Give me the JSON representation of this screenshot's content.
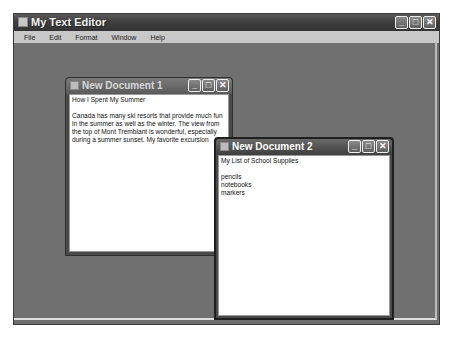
{
  "app": {
    "title": "My Text Editor",
    "controls": {
      "minimize": "_",
      "maximize": "□",
      "close": "✕"
    }
  },
  "menu": {
    "items": [
      {
        "label": "File"
      },
      {
        "label": "Edit"
      },
      {
        "label": "Format"
      },
      {
        "label": "Window"
      },
      {
        "label": "Help"
      }
    ]
  },
  "documents": [
    {
      "title": "New Document 1",
      "content": "How I Spent My Summer\n\nCanada has many ski resorts that provide much fun in the summer as well as the winter. The view from the top of Mont Tremblant is wonderful, especially during a summer sunset. My favorite excursion"
    },
    {
      "title": "New Document 2",
      "content": "My List of School Supplies\n\npencils\nnotebooks\nmarkers"
    }
  ]
}
